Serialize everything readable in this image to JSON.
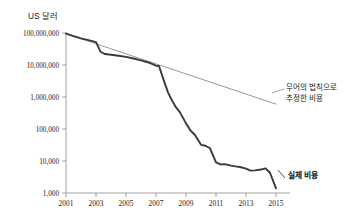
{
  "chart_data": {
    "type": "line",
    "title": "",
    "xlabel": "",
    "ylabel": "US 달러",
    "y_scale": "log",
    "ylim": [
      1000,
      100000000
    ],
    "xlim": [
      2001,
      2015.4
    ],
    "grid": false,
    "legend_position": "inline-annotation",
    "y_tick_labels": [
      "100,000,000",
      "10,000,000",
      "1,000,000",
      "100,000",
      "10,000",
      "1,000"
    ],
    "y_tick_values": [
      100000000,
      10000000,
      1000000,
      100000,
      10000,
      1000
    ],
    "x_tick_labels": [
      "2001",
      "2003",
      "2005",
      "2007",
      "2009",
      "2011",
      "2013",
      "2015"
    ],
    "x_tick_values": [
      2001,
      2003,
      2005,
      2007,
      2009,
      2011,
      2013,
      2015
    ],
    "series": [
      {
        "name": "실제 비용",
        "color": "#3a3a3a",
        "annotation": "실제 비용",
        "x": [
          2001.0,
          2001.5,
          2002.0,
          2002.5,
          2003.0,
          2003.3,
          2003.6,
          2004.0,
          2004.5,
          2005.0,
          2005.5,
          2006.0,
          2006.5,
          2007.0,
          2007.2,
          2007.5,
          2007.8,
          2008.0,
          2008.3,
          2008.6,
          2009.0,
          2009.3,
          2009.6,
          2010.0,
          2010.3,
          2010.6,
          2011.0,
          2011.3,
          2011.6,
          2012.0,
          2012.3,
          2012.6,
          2013.0,
          2013.3,
          2013.6,
          2014.0,
          2014.3,
          2014.6,
          2015.0
        ],
        "values": [
          95000000,
          80000000,
          68000000,
          60000000,
          52000000,
          26000000,
          22000000,
          21000000,
          19500000,
          18000000,
          16000000,
          14000000,
          12000000,
          9500000,
          9300000,
          3500000,
          1400000,
          900000,
          500000,
          330000,
          150000,
          90000,
          65000,
          32000,
          30000,
          25000,
          9000,
          7800,
          8000,
          7200,
          6800,
          6500,
          5800,
          5000,
          5100,
          5400,
          5900,
          4300,
          1400
        ]
      },
      {
        "name": "무어의 법칙으로 추정한 비용",
        "color": "#8f8f8f",
        "annotation_line_1": "무어의 법칙으로",
        "annotation_line_2": "추정한 비용",
        "x": [
          2001.0,
          2015.0
        ],
        "values": [
          95000000,
          600000
        ]
      }
    ],
    "annotations": [
      {
        "name": "moore-label",
        "text_line_1": "무어의 법칙으로",
        "text_line_2": "추정한 비용"
      },
      {
        "name": "actual-label",
        "text": "실제 비용"
      }
    ]
  },
  "axis": {
    "y_title": "US 달러"
  },
  "colors": {
    "actual_series": "#3a3a3a",
    "moore_series": "#8f8f8f",
    "axis": "#8a8a8a",
    "text": "#1a1a1a",
    "background": "#ffffff"
  }
}
